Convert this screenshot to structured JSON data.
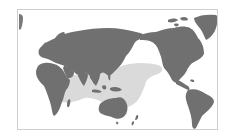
{
  "map": {
    "projection": "world map, Pacific-centered",
    "colors": {
      "background": "#ffffff",
      "land": "#707070",
      "highlight_region": "#dadada",
      "frame_border": "#cfcfcf"
    },
    "highlighted_region": {
      "description": "Shaded distribution area covering the Indian Ocean, Southeast Asia, northern Australia and the western/central Pacific"
    },
    "regions": [
      {
        "name": "Africa"
      },
      {
        "name": "Europe"
      },
      {
        "name": "Asia"
      },
      {
        "name": "Australia"
      },
      {
        "name": "North America"
      },
      {
        "name": "Greenland"
      },
      {
        "name": "South America"
      }
    ]
  }
}
